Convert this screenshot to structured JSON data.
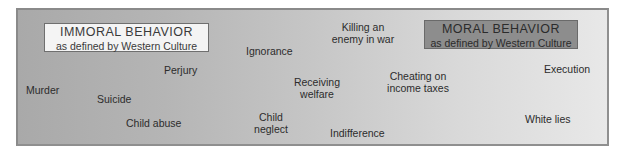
{
  "diagram": {
    "type": "continuum",
    "left_label": {
      "title": "IMMORAL BEHAVIOR",
      "subtitle": "as defined by Western Culture"
    },
    "right_label": {
      "title": "MORAL BEHAVIOR",
      "subtitle": "as defined by Western Culture"
    },
    "items": [
      {
        "id": "murder",
        "lines": [
          "Murder"
        ]
      },
      {
        "id": "suicide",
        "lines": [
          "Suicide"
        ]
      },
      {
        "id": "perjury",
        "lines": [
          "Perjury"
        ]
      },
      {
        "id": "child-abuse",
        "lines": [
          "Child abuse"
        ]
      },
      {
        "id": "ignorance",
        "lines": [
          "Ignorance"
        ]
      },
      {
        "id": "child-neglect",
        "lines": [
          "Child",
          "neglect"
        ]
      },
      {
        "id": "receiving-welfare",
        "lines": [
          "Receiving",
          "welfare"
        ]
      },
      {
        "id": "killing-enemy",
        "lines": [
          "Killing an",
          "enemy in war"
        ]
      },
      {
        "id": "indifference",
        "lines": [
          "Indifference"
        ]
      },
      {
        "id": "cheating-taxes",
        "lines": [
          "Cheating on",
          "income taxes"
        ]
      },
      {
        "id": "execution",
        "lines": [
          "Execution"
        ]
      },
      {
        "id": "white-lies",
        "lines": [
          "White lies"
        ]
      }
    ]
  }
}
